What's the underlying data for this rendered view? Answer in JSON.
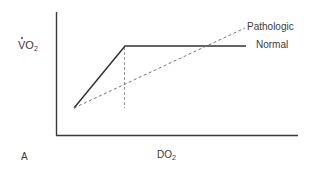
{
  "diagram": {
    "panel_label": "A",
    "y_axis": {
      "label_main": "VO",
      "label_sub": "2",
      "dot_over_v": true
    },
    "x_axis": {
      "label_main": "DO",
      "label_sub": "2"
    },
    "series": [
      {
        "name": "Normal",
        "style": "solid",
        "points": [
          [
            74,
            108
          ],
          [
            125,
            46
          ],
          [
            246,
            46
          ]
        ]
      },
      {
        "name": "Pathologic",
        "style": "dashed",
        "points": [
          [
            74,
            108
          ],
          [
            245,
            28
          ]
        ]
      }
    ],
    "guides": [
      {
        "style": "dashed",
        "from": [
          124,
          46
        ],
        "to": [
          124,
          108
        ],
        "meaning": "critical DO2 threshold"
      }
    ],
    "colors": {
      "line": "#333333",
      "dashed": "#777777",
      "axis": "#3a3a3a"
    }
  }
}
